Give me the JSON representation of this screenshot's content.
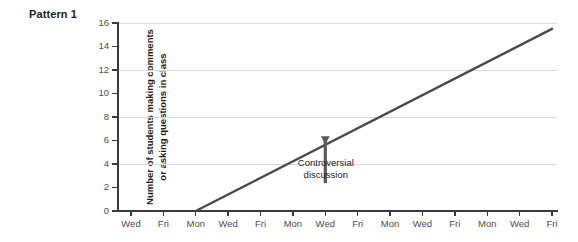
{
  "pattern_label": "Pattern 1",
  "annotation": {
    "line1": "Controversial",
    "line2": "discussion"
  },
  "chart_data": {
    "type": "line",
    "title": "Pattern 1",
    "xlabel": "",
    "ylabel": "Number of students making comments or asking questions in class",
    "ylabel_line1": "Number of students making comments",
    "ylabel_line2": "or asking questions in class",
    "ylim": [
      0,
      16
    ],
    "yticks": [
      0,
      2,
      4,
      6,
      8,
      10,
      12,
      14,
      16
    ],
    "ytick_labels": [
      "0",
      "2",
      "4",
      "6",
      "8",
      "10",
      "12",
      "14",
      "16"
    ],
    "gridlines_y": [
      4,
      8,
      12,
      16
    ],
    "grid": true,
    "legend": "none",
    "categories": [
      "Wed",
      "Fri",
      "Mon",
      "Wed",
      "Fri",
      "Mon",
      "Wed",
      "Fri",
      "Mon",
      "Wed",
      "Fri",
      "Mon",
      "Wed",
      "Fri"
    ],
    "x_index": [
      0,
      1,
      2,
      3,
      4,
      5,
      6,
      7,
      8,
      9,
      10,
      11,
      12,
      13
    ],
    "series": [
      {
        "name": "Students making comments or asking questions",
        "color": "#4a4a4a",
        "values": [
          null,
          null,
          0,
          1.4,
          2.8,
          4.2,
          5.6,
          7.0,
          8.4,
          9.9,
          11.3,
          12.7,
          14.1,
          15.5
        ]
      }
    ],
    "annotations": [
      {
        "text": "Controversial discussion",
        "points_to_category": "Wed",
        "points_to_x_index": 6,
        "points_to_value": 5.6,
        "arrow": "down"
      }
    ],
    "line_start": {
      "x_index": 2,
      "category": "Mon",
      "value": 0
    },
    "line_end": {
      "x_index": 13,
      "category": "Fri",
      "value": 15.5
    }
  },
  "colors": {
    "line": "#4a4a4a",
    "grid": "#d9d9d9",
    "axis": "#3a3a3a",
    "tick_text": "#4d4d4d",
    "text": "#231f20",
    "background": "#ffffff"
  }
}
